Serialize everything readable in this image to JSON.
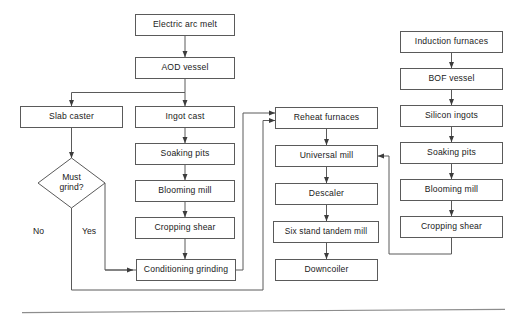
{
  "diagram": {
    "stroke_color": "#5a5a5a",
    "text_color": "#1a1a1a",
    "background_color": "#ffffff",
    "rule_color": "#8d8d8d"
  },
  "nodes": {
    "electric_arc_melt": "Electric arc melt",
    "aod_vessel": "AOD vessel",
    "slab_caster": "Slab caster",
    "ingot_cast": "Ingot cast",
    "soaking_pits_left": "Soaking pits",
    "blooming_mill_left": "Blooming mill",
    "cropping_shear_left": "Cropping shear",
    "conditioning_grinding": "Conditioning grinding",
    "reheat_furnaces": "Reheat furnaces",
    "universal_mill": "Universal mill",
    "descaler": "Descaler",
    "six_stand_tandem_mill": "Six stand tandem mill",
    "downcoiler": "Downcoiler",
    "induction_furnaces": "Induction furnaces",
    "bof_vessel": "BOF vessel",
    "silicon_ingots": "Silicon ingots",
    "soaking_pits_right": "Soaking pits",
    "blooming_mill_right": "Blooming mill",
    "cropping_shear_right": "Cropping shear"
  },
  "decisions": {
    "must_grind_line1": "Must",
    "must_grind_line2": "grind?"
  },
  "edge_labels": {
    "no": "No",
    "yes": "Yes"
  }
}
